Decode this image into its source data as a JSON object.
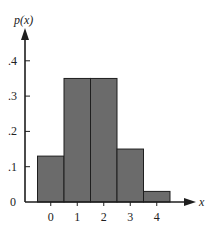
{
  "chart_data": {
    "type": "bar",
    "title": "",
    "xlabel": "x",
    "ylabel": "p(x)",
    "categories": [
      "0",
      "1",
      "2",
      "3",
      "4"
    ],
    "values": [
      0.13,
      0.35,
      0.35,
      0.15,
      0.03
    ],
    "ylim": [
      0,
      0.45
    ],
    "yticks": [
      0,
      0.1,
      0.2,
      0.3,
      0.4
    ],
    "ytick_labels": [
      "0",
      ".1",
      ".2",
      ".3",
      ".4"
    ],
    "xtick_labels": [
      "0",
      "1",
      "2",
      "3",
      "4"
    ],
    "grid": false,
    "legend": null,
    "bar_color": "#6b6b6b",
    "bar_edge_color": "#1e1e1e",
    "bar_width": 1.0
  },
  "labels": {
    "y_axis": "p(x)",
    "x_axis": "x"
  }
}
